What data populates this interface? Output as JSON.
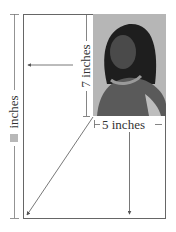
{
  "diagram": {
    "labels": {
      "height_unknown": "inches",
      "photo_height": "7 inches",
      "photo_width": "5 inches"
    },
    "unknown_marker_color": "#b8b8b8",
    "photo": {
      "description": "grayscale portrait photo of a girl",
      "width_in": 5,
      "height_in": 7
    },
    "colors": {
      "line": "#555555",
      "frame": "#666666",
      "text": "#333333"
    }
  }
}
